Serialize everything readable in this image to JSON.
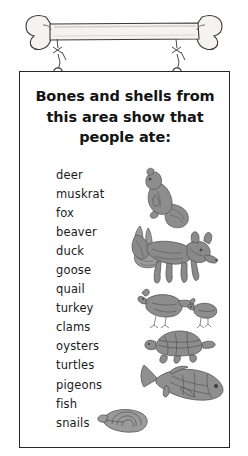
{
  "illustration": {
    "hanging_bone": "bone-illustration",
    "strings": "hanging-strings",
    "rings": "hanging-rings"
  },
  "sign": {
    "heading_lines": [
      "Bones and shells from",
      "this area show that",
      "people ate:"
    ],
    "items": [
      "deer",
      "muskrat",
      "fox",
      "beaver",
      "duck",
      "goose",
      "quail",
      "turkey",
      "clams",
      "oysters",
      "turtles",
      "pigeons",
      "fish",
      "snails"
    ],
    "figures": [
      "muskrat-illustration",
      "rabbit-illustration",
      "fox-illustration",
      "quail-illustration",
      "turtle-illustration",
      "fish-illustration",
      "snail-shell-illustration"
    ]
  },
  "colors": {
    "background": "#ffffff",
    "frame_border": "#262626",
    "text": "#1a1a1a",
    "heading_text": "#141414",
    "art_ink": "#6e6e6e",
    "bone_fill": "#f2f1ef"
  }
}
